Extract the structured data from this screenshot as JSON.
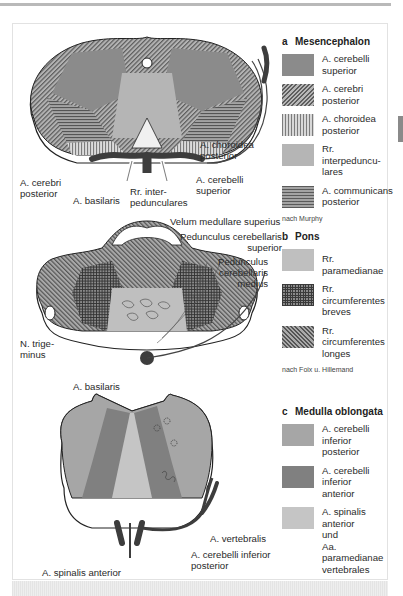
{
  "figure": {
    "panels": [
      {
        "id": "a",
        "letter": "a",
        "title": "Mesencephalon",
        "legend": [
          {
            "label": "A. cerebelli superior",
            "pattern": "solid-dark"
          },
          {
            "label": "A. cerebri posterior",
            "pattern": "diagonal-hatch"
          },
          {
            "label": "A. choroidea posterior",
            "pattern": "vertical-lines"
          },
          {
            "label": "Rr. interpedunculares",
            "pattern": "solid-light"
          },
          {
            "label": "A. communicans posterior",
            "pattern": "horizontal-lines"
          }
        ],
        "source": "nach Murphy",
        "labels": {
          "choroidea": "A. choroidea posterior",
          "cerebri": "A. cerebri posterior",
          "cerebelli": "A. cerebelli superior",
          "basilaris": "A. basilaris",
          "interped": "Rr. interpedunculares"
        }
      },
      {
        "id": "b",
        "letter": "b",
        "title": "Pons",
        "legend": [
          {
            "label": "Rr. paramedianae",
            "pattern": "solid-light"
          },
          {
            "label": "Rr. circumferentes breves",
            "pattern": "cross-hatch"
          },
          {
            "label": "Rr. circumferentes longes",
            "pattern": "diagonal-hatch"
          }
        ],
        "source": "nach Foix u. Hillemand",
        "labels": {
          "velum": "Velum medullare superius",
          "ped_sup": "Pedunculus cerebellaris superior",
          "ped_med": "Pedunculus cerebellaris medius",
          "trigeminus": "N. trigeminus",
          "basilaris": "A. basilaris"
        }
      },
      {
        "id": "c",
        "letter": "c",
        "title": "Medulla oblongata",
        "legend": [
          {
            "label": "A. cerebelli inferior posterior",
            "pattern": "solid-mid"
          },
          {
            "label": "A. cerebelli inferior anterior",
            "pattern": "solid-dark"
          },
          {
            "label": "A. spinalis anterior und Aa. paramedianae vertebrales",
            "pattern": "solid-light"
          }
        ],
        "labels": {
          "vertebralis": "A. vertebralis",
          "pica": "A. cerebelli inferior posterior",
          "spinalis": "A. spinalis anterior"
        }
      }
    ]
  },
  "text": {
    "a_letter": "a",
    "a_title": "Mesencephalon",
    "a_l1": "A. cerebelli",
    "a_l1b": "superior",
    "a_l2": "A. cerebri",
    "a_l2b": "posterior",
    "a_l3": "A. choroidea",
    "a_l3b": "posterior",
    "a_l4": "Rr. interpeduncu-",
    "a_l4b": "lares",
    "a_l5": "A. communicans",
    "a_l5b": "posterior",
    "a_src": "nach Murphy",
    "a_lab_chor1": "A. choroidea",
    "a_lab_chor2": "posterior",
    "a_lab_cer1": "A. cerebri",
    "a_lab_cer2": "posterior",
    "a_lab_cbl1": "A. cerebelli",
    "a_lab_cbl2": "superior",
    "a_lab_bas": "A. basilaris",
    "a_lab_int1": "Rr. inter-",
    "a_lab_int2": "pedunculares",
    "b_letter": "b",
    "b_title": "Pons",
    "b_l1": "Rr. paramedianae",
    "b_l2": "Rr. circumferentes",
    "b_l2b": "breves",
    "b_l3": "Rr. circumferentes",
    "b_l3b": "longes",
    "b_src": "nach Foix u. Hillemand",
    "b_lab_velum": "Velum medullare superius",
    "b_lab_psup1": "Pedunculus cerebellaris",
    "b_lab_psup2": "superior",
    "b_lab_pmed1": "Pedunculus",
    "b_lab_pmed2": "cerebellaris",
    "b_lab_pmed3": "medius",
    "b_lab_tri1": "N. trige-",
    "b_lab_tri2": "minus",
    "b_lab_bas": "A. basilaris",
    "c_letter": "c",
    "c_title": "Medulla oblongata",
    "c_l1": "A. cerebelli inferior",
    "c_l1b": "posterior",
    "c_l2": "A. cerebelli inferior",
    "c_l2b": "anterior",
    "c_l3": "A. spinalis anterior",
    "c_l3b": "und",
    "c_l3c": "Aa. paramedianae",
    "c_l3d": "vertebrales",
    "c_lab_vert": "A. vertebralis",
    "c_lab_pica1": "A. cerebelli inferior",
    "c_lab_pica2": "posterior",
    "c_lab_spin": "A. spinalis anterior"
  },
  "colors": {
    "frame_border": "#e2e2e2",
    "top_rule": "#b9b9b9",
    "dark_gray": "#8b8b8b",
    "light_gray": "#bfbfbf",
    "artery": "#3d3d3d"
  }
}
